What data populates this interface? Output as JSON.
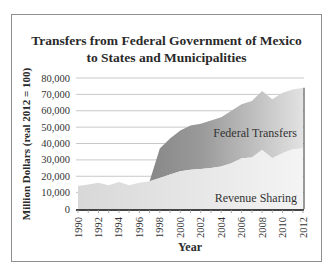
{
  "chart_data": {
    "type": "area",
    "stacked": true,
    "title": "Transfers from Federal Government of Mexico to States and Municipalities",
    "title_lines": [
      "Transfers from Federal Government of Mexico",
      "to States and Municipalities"
    ],
    "xlabel": "Year",
    "ylabel": "Million Dollars (real 2012 = 100)",
    "ylim": [
      0,
      80000
    ],
    "yticks": [
      0,
      10000,
      20000,
      30000,
      40000,
      50000,
      60000,
      70000,
      80000
    ],
    "ytick_labels": [
      "0",
      "10,000",
      "20,000",
      "30,000",
      "40,000",
      "50,000",
      "60,000",
      "70,000",
      "80,000"
    ],
    "xtick_labels": [
      "1990",
      "1992",
      "1994",
      "1996",
      "1998",
      "2000",
      "2002",
      "2004",
      "2006",
      "2008",
      "2010",
      "2012"
    ],
    "grid": true,
    "legend_position": "inline labels",
    "x": [
      1990,
      1991,
      1992,
      1993,
      1994,
      1995,
      1996,
      1997,
      1998,
      1999,
      2000,
      2001,
      2002,
      2003,
      2004,
      2005,
      2006,
      2007,
      2008,
      2009,
      2010,
      2011,
      2012
    ],
    "series": [
      {
        "name": "Revenue Sharing",
        "color": "#e6e6e6",
        "values": [
          14000,
          15000,
          16000,
          14500,
          16500,
          14500,
          16000,
          17000,
          19000,
          21000,
          23000,
          24000,
          24500,
          25000,
          26000,
          28000,
          31000,
          31500,
          36000,
          31000,
          34000,
          36500,
          37000
        ]
      },
      {
        "name": "Federal Transfers",
        "color": "#8c8c8c",
        "values": [
          0,
          0,
          0,
          0,
          0,
          0,
          0,
          0,
          18000,
          22000,
          25000,
          27000,
          27500,
          29000,
          30000,
          32000,
          33000,
          34500,
          36000,
          36000,
          37000,
          36500,
          37000
        ]
      }
    ],
    "annotations": [
      "Federal Transfers",
      "Revenue Sharing"
    ]
  }
}
